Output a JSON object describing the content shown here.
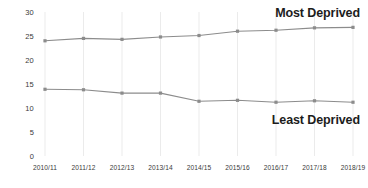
{
  "chart_data": {
    "type": "line",
    "title": "",
    "subtitle": "",
    "xlabel": "",
    "ylabel": "",
    "categories": [
      "2010/11",
      "2011/12",
      "2012/13",
      "2013/14",
      "2014/15",
      "2015/16",
      "2016/17",
      "2017/18",
      "2018/19"
    ],
    "series": [
      {
        "name": "Most Deprived",
        "values": [
          24.0,
          24.5,
          24.3,
          24.8,
          25.1,
          26.0,
          26.2,
          26.7,
          26.8
        ],
        "color": "#8c8c8c",
        "annotation_position": "top-right"
      },
      {
        "name": "Least Deprived",
        "values": [
          13.9,
          13.8,
          13.1,
          13.1,
          11.4,
          11.6,
          11.2,
          11.5,
          11.2
        ],
        "color": "#8c8c8c",
        "annotation_position": "bottom-right"
      }
    ],
    "ylim": [
      0,
      30
    ],
    "yticks": [
      0,
      5,
      10,
      15,
      20,
      25,
      30
    ],
    "ytick_labels": [
      "0",
      "5",
      "10",
      "15",
      "20",
      "25",
      "30"
    ],
    "grid": "vertical",
    "grid_color": "#ebebeb",
    "legend": "inline-annotations",
    "background": "#ffffff",
    "marker": "square"
  }
}
